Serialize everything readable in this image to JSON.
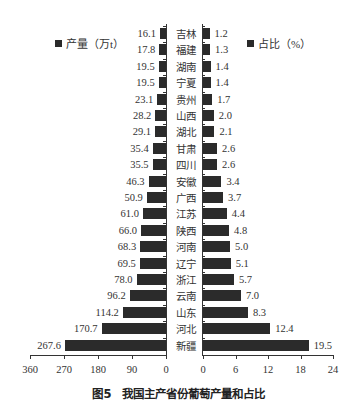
{
  "chart_data": {
    "type": "bar",
    "orientation": "horizontal-butterfly",
    "categories": [
      "吉林",
      "福建",
      "湖南",
      "宁夏",
      "贵州",
      "山西",
      "湖北",
      "甘肃",
      "四川",
      "安徽",
      "广西",
      "江苏",
      "陕西",
      "河南",
      "辽宁",
      "浙江",
      "云南",
      "山东",
      "河北",
      "新疆"
    ],
    "series": [
      {
        "name": "产量（万t）",
        "side": "left",
        "values": [
          16.1,
          17.8,
          19.5,
          19.5,
          23.1,
          28.2,
          29.1,
          35.4,
          35.5,
          46.3,
          50.9,
          61.0,
          66.0,
          68.3,
          69.5,
          78.0,
          96.2,
          114.2,
          170.7,
          267.6
        ],
        "xlim": [
          360,
          0
        ],
        "ticks": [
          "360",
          "270",
          "180",
          "90",
          "0"
        ]
      },
      {
        "name": "占比（%）",
        "side": "right",
        "values": [
          1.2,
          1.3,
          1.4,
          1.4,
          1.7,
          2.0,
          2.1,
          2.6,
          2.6,
          3.4,
          3.7,
          4.4,
          4.8,
          5.0,
          5.1,
          5.7,
          7.0,
          8.3,
          12.4,
          19.5
        ],
        "xlim": [
          0,
          24
        ],
        "ticks": [
          "0",
          "6",
          "12",
          "18",
          "24"
        ]
      }
    ],
    "value_labels": {
      "left": [
        "16.1",
        "17.8",
        "19.5",
        "19.5",
        "23.1",
        "28.2",
        "29.1",
        "35.4",
        "35.5",
        "46.3",
        "50.9",
        "61.0",
        "66.0",
        "68.3",
        "69.5",
        "78.0",
        "96.2",
        "114.2",
        "170.7",
        "267.6"
      ],
      "right": [
        "1.2",
        "1.3",
        "1.4",
        "1.4",
        "1.7",
        "2.0",
        "2.1",
        "2.6",
        "2.6",
        "3.4",
        "3.7",
        "4.4",
        "4.8",
        "5.0",
        "5.1",
        "5.7",
        "7.0",
        "8.3",
        "12.4",
        "19.5"
      ]
    },
    "legend": {
      "left": "产量（万t）",
      "right": "占比（%）",
      "position": "top"
    },
    "grid": false,
    "bar_color": "#2b2b2b"
  },
  "legend": {
    "left_label": "产量（万t）",
    "right_label": "占比（%）"
  },
  "caption": "图5　我国主产省份葡萄产量和占比"
}
